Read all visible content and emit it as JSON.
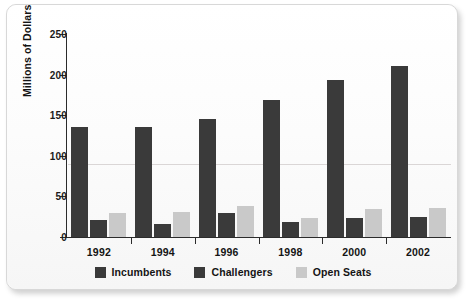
{
  "chart_data": {
    "type": "bar",
    "title": "",
    "subtitle": "",
    "xlabel": "",
    "ylabel": "Millions of Dollars",
    "categories": [
      "1992",
      "1994",
      "1996",
      "1998",
      "2000",
      "2002"
    ],
    "series": [
      {
        "name": "Incumbents",
        "color": "#3a3a3a",
        "values": [
          135,
          136,
          145,
          169,
          193,
          210
        ]
      },
      {
        "name": "Challengers",
        "color": "#3a3a3a",
        "values": [
          21,
          16,
          29,
          19,
          24,
          25
        ]
      },
      {
        "name": "Open Seats",
        "color": "#c9c9c9",
        "values": [
          29,
          31,
          38,
          24,
          34,
          36
        ]
      }
    ],
    "ylim": [
      0,
      250
    ],
    "yticks": [
      0,
      50,
      100,
      150,
      200,
      250
    ],
    "ytick_labels": [
      "0",
      "50",
      "100",
      "150",
      "200",
      "250"
    ],
    "grid": false,
    "legend_position": "bottom",
    "legend_entries": [
      "Incumbents",
      "Challengers",
      "Open Seats"
    ],
    "annotations": []
  },
  "colors": {
    "dark_bar": "#3a3a3a",
    "light_bar": "#c9c9c9",
    "axis": "#2b2b2b",
    "text": "#141414",
    "card_background": "#fbfbfb",
    "card_border": "#d8d8d8",
    "page_background": "#ffffff"
  }
}
